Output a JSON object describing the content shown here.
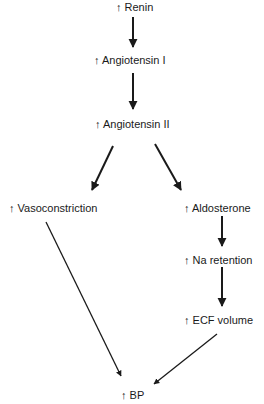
{
  "diagram": {
    "nodes": [
      {
        "id": "renin",
        "label": "↑ Renin"
      },
      {
        "id": "ang1",
        "label": "↑ Angiotensin I"
      },
      {
        "id": "ang2",
        "label": "↑ Angiotensin II"
      },
      {
        "id": "vaso",
        "label": "↑ Vasoconstriction"
      },
      {
        "id": "aldo",
        "label": "↑ Aldosterone"
      },
      {
        "id": "na",
        "label": "↑ Na retention"
      },
      {
        "id": "ecf",
        "label": "↑ ECF volume"
      },
      {
        "id": "bp",
        "label": "↑ BP"
      }
    ],
    "edges": [
      {
        "from": "renin",
        "to": "ang1"
      },
      {
        "from": "ang1",
        "to": "ang2"
      },
      {
        "from": "ang2",
        "to": "vaso"
      },
      {
        "from": "ang2",
        "to": "aldo"
      },
      {
        "from": "aldo",
        "to": "na"
      },
      {
        "from": "na",
        "to": "ecf"
      },
      {
        "from": "vaso",
        "to": "bp"
      },
      {
        "from": "ecf",
        "to": "bp"
      }
    ],
    "colors": {
      "stroke": "#1a1a1a",
      "background": "#ffffff"
    }
  }
}
